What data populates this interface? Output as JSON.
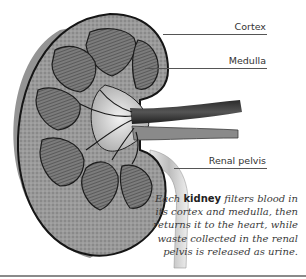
{
  "figure": {
    "labels": [
      {
        "id": "cortex",
        "text": "Cortex"
      },
      {
        "id": "medulla",
        "text": "Medulla"
      },
      {
        "id": "renal_pelvis",
        "text": "Renal pelvis"
      }
    ],
    "caption": {
      "prefix": "Each ",
      "bold": "kidney",
      "suffix": " filters blood in its cortex and medulla, then returns it to the heart, while waste collected in the renal pelvis is released as urine."
    },
    "colors": {
      "tissue_dark": "#4a4a4a",
      "tissue_mid": "#8c8c8c",
      "tissue_light": "#bdbdbd",
      "outline": "#1a1a1a",
      "leader_line": "#555555",
      "text": "#333333"
    }
  }
}
